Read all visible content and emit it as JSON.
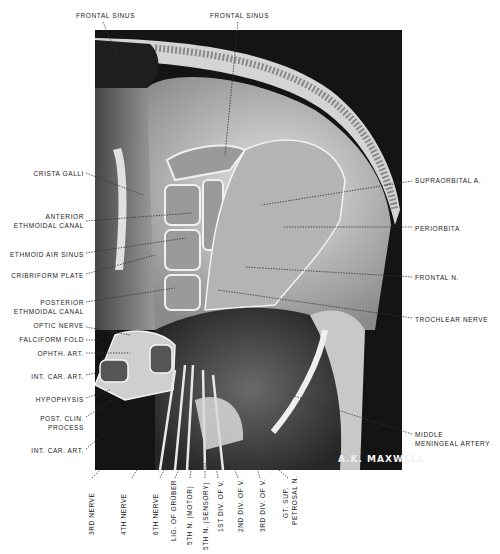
{
  "figure": {
    "signature": "A.K. MAXWELL",
    "colors": {
      "background": "#ffffff",
      "plate_dark": "#141414",
      "bone": "#d9d9d9",
      "label_text": "#222222"
    }
  },
  "labels": {
    "top": [
      {
        "id": "frontal-sinus-1",
        "text": "FRONTAL SINUS"
      },
      {
        "id": "frontal-sinus-2",
        "text": "FRONTAL SINUS"
      }
    ],
    "left": [
      {
        "id": "crista-galli",
        "lines": [
          "CRISTA GALLI"
        ]
      },
      {
        "id": "anterior-ethmoidal-canal",
        "lines": [
          "ANTERIOR",
          "ETHMOIDAL CANAL"
        ]
      },
      {
        "id": "ethmoid-air-sinus",
        "lines": [
          "ETHMOID AIR SINUS"
        ]
      },
      {
        "id": "cribriform-plate",
        "lines": [
          "CRIBRIFORM PLATE"
        ]
      },
      {
        "id": "posterior-ethmoidal-canal",
        "lines": [
          "POSTERIOR",
          "ETHMOIDAL CANAL"
        ]
      },
      {
        "id": "optic-nerve",
        "lines": [
          "OPTIC NERVE"
        ]
      },
      {
        "id": "falciform-fold",
        "lines": [
          "FALCIFORM FOLD"
        ]
      },
      {
        "id": "ophth-art",
        "lines": [
          "OPHTH. ART."
        ]
      },
      {
        "id": "int-car-art-1",
        "lines": [
          "INT. CAR. ART."
        ]
      },
      {
        "id": "hypophysis",
        "lines": [
          "HYPOPHYSIS"
        ]
      },
      {
        "id": "post-clin-process",
        "lines": [
          "POST. CLIN.",
          "PROCESS"
        ]
      },
      {
        "id": "int-car-art-2",
        "lines": [
          "INT. CAR. ART."
        ]
      }
    ],
    "right": [
      {
        "id": "supraorbital-a",
        "lines": [
          "SUPRAORBITAL A."
        ]
      },
      {
        "id": "periorbita",
        "lines": [
          "PERIORBITA"
        ]
      },
      {
        "id": "frontal-n",
        "lines": [
          "FRONTAL N."
        ]
      },
      {
        "id": "trochlear-nerve",
        "lines": [
          "TROCHLEAR NERVE"
        ]
      },
      {
        "id": "middle-meningeal-artery",
        "lines": [
          "MIDDLE",
          "MENINGEAL ARTERY"
        ]
      }
    ],
    "bottom": [
      {
        "id": "3rd-nerve",
        "lines": [
          "3RD NERVE"
        ]
      },
      {
        "id": "4th-nerve",
        "lines": [
          "4TH NERVE"
        ]
      },
      {
        "id": "6th-nerve",
        "lines": [
          "6TH NERVE"
        ]
      },
      {
        "id": "lig-of-gruber",
        "lines": [
          "LIG. OF GRÜBER"
        ]
      },
      {
        "id": "5th-n-motor",
        "lines": [
          "5TH N. (MOTOR)"
        ]
      },
      {
        "id": "5th-n-sensory",
        "lines": [
          "5TH N. (SENSORY)"
        ]
      },
      {
        "id": "1st-div-of-v",
        "lines": [
          "1ST DIV. OF V."
        ]
      },
      {
        "id": "2nd-div-of-v",
        "lines": [
          "2ND DIV. OF V."
        ]
      },
      {
        "id": "3rd-div-of-v",
        "lines": [
          "3RD DIV. OF V."
        ]
      },
      {
        "id": "gt-sup-petrosal-n",
        "lines": [
          "GT. SUP.",
          "PETROSAL N."
        ]
      }
    ]
  }
}
